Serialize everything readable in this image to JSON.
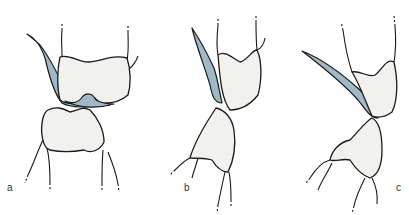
{
  "figure": {
    "panels": [
      {
        "id": "a",
        "label": "a"
      },
      {
        "id": "b",
        "label": "b"
      },
      {
        "id": "c",
        "label": "c"
      }
    ],
    "colors": {
      "crown_fill": "#f1f2ee",
      "overlay_fill": "#9fb9c6",
      "outline": "#1a1a1a"
    }
  }
}
